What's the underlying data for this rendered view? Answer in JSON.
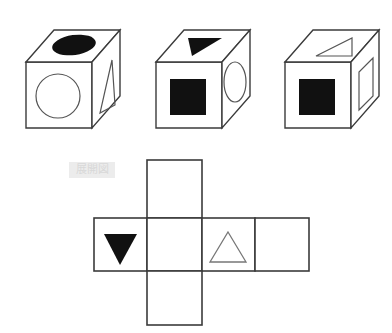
{
  "figure": {
    "title": "",
    "type": "cube-and-net-puzzle",
    "stroke_color": "#3b3b3b",
    "fill_color": "#111111",
    "background_color": "#ffffff",
    "net_label_text": "展開図",
    "net_label_background": "#ececec",
    "net_label_color": "#d8d8d8"
  },
  "cubes": [
    {
      "index": 1,
      "name": "cube-1",
      "faces": {
        "top": {
          "shape": "ellipse",
          "fill": "solid-black"
        },
        "front": {
          "shape": "circle",
          "fill": "outline"
        },
        "right": {
          "shape": "triangle",
          "fill": "outline"
        }
      }
    },
    {
      "index": 2,
      "name": "cube-2",
      "faces": {
        "top": {
          "shape": "triangle",
          "fill": "solid-black"
        },
        "front": {
          "shape": "square",
          "fill": "solid-black"
        },
        "right": {
          "shape": "ellipse",
          "fill": "outline"
        }
      }
    },
    {
      "index": 3,
      "name": "cube-3",
      "faces": {
        "top": {
          "shape": "triangle",
          "fill": "outline"
        },
        "front": {
          "shape": "square",
          "fill": "solid-black"
        },
        "right": {
          "shape": "rectangle",
          "fill": "outline"
        }
      }
    }
  ],
  "net": {
    "name": "cube-net",
    "layout": "cross",
    "columns": 4,
    "rows": 3,
    "cells": [
      {
        "row": 0,
        "col": 1,
        "shape": "none",
        "fill": "none"
      },
      {
        "row": 1,
        "col": 0,
        "shape": "triangle-down",
        "fill": "solid-black"
      },
      {
        "row": 1,
        "col": 1,
        "shape": "none",
        "fill": "none"
      },
      {
        "row": 1,
        "col": 2,
        "shape": "triangle-up",
        "fill": "outline"
      },
      {
        "row": 1,
        "col": 3,
        "shape": "none",
        "fill": "none"
      },
      {
        "row": 2,
        "col": 1,
        "shape": "none",
        "fill": "none"
      }
    ]
  }
}
